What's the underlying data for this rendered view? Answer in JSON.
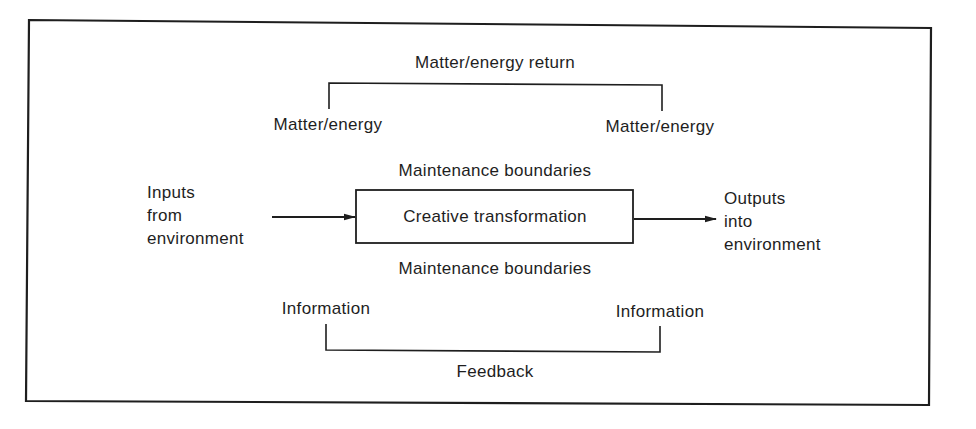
{
  "diagram": {
    "type": "system-model",
    "top_bracket": {
      "label": "Matter/energy return",
      "left_end_label": "Matter/energy",
      "right_end_label": "Matter/energy"
    },
    "maintenance_top_label": "Maintenance boundaries",
    "maintenance_bottom_label": "Maintenance boundaries",
    "center_box": {
      "label": "Creative transformation"
    },
    "input": {
      "lines": [
        "Inputs",
        "from",
        "environment"
      ]
    },
    "output": {
      "lines": [
        "Outputs",
        "into",
        "environment"
      ]
    },
    "bottom_bracket": {
      "label": "Feedback",
      "left_end_label": "Information",
      "right_end_label": "Information"
    },
    "edges": [
      {
        "from": "input",
        "to": "center_box",
        "type": "arrow"
      },
      {
        "from": "center_box",
        "to": "output",
        "type": "arrow"
      },
      {
        "from": "top_bracket.left_end",
        "to": "top_bracket.right_end",
        "type": "bracket",
        "label": "Matter/energy return"
      },
      {
        "from": "bottom_bracket.left_end",
        "to": "bottom_bracket.right_end",
        "type": "bracket",
        "label": "Feedback"
      }
    ],
    "colors": {
      "ink": "#1e1e1e",
      "background": "#ffffff"
    }
  }
}
